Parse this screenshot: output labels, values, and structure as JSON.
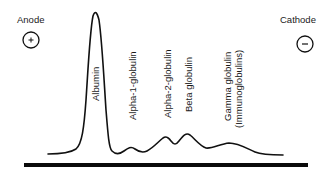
{
  "diagram": {
    "type": "serum protein electrophoresis",
    "electrodes": {
      "anode": {
        "label": "Anode",
        "symbol": "+"
      },
      "cathode": {
        "label": "Cathode",
        "symbol": "−"
      }
    },
    "peaks": [
      {
        "label": "Albumin"
      },
      {
        "label": "Alpha-1-globulin"
      },
      {
        "label": "Alpha-2-globulin"
      },
      {
        "label": "Beta globulin"
      },
      {
        "label": "Gamma globulin",
        "sublabel": "(Immunoglobulins)"
      }
    ],
    "colors": {
      "line": "#111111",
      "background": "#ffffff"
    }
  }
}
